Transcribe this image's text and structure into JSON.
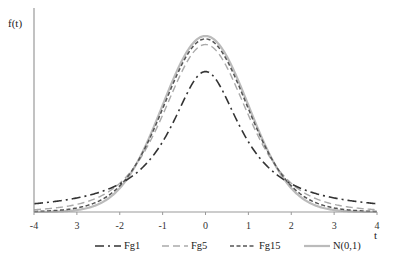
{
  "chart_data": {
    "type": "line",
    "title": "",
    "xlabel": "t",
    "ylabel": "f(t)",
    "xlim": [
      -4,
      4
    ],
    "ylim": [
      0,
      0.42
    ],
    "x_ticks": [
      -4,
      -3,
      -2,
      -1,
      0,
      1,
      2,
      3,
      4
    ],
    "x_tick_labels": [
      "-4",
      "3",
      "-2",
      "-1",
      "0",
      "1",
      "2",
      "3",
      "4"
    ],
    "grid": false,
    "legend_position": "bottom",
    "series": [
      {
        "name": "Fg1",
        "style": "dash-dot",
        "color": "#333333",
        "df": 1,
        "peak": 0.318,
        "values": [
          [
            -4,
            0.019
          ],
          [
            -3,
            0.032
          ],
          [
            -2,
            0.064
          ],
          [
            -1,
            0.159
          ],
          [
            0,
            0.318
          ],
          [
            1,
            0.159
          ],
          [
            2,
            0.064
          ],
          [
            3,
            0.032
          ],
          [
            4,
            0.019
          ]
        ]
      },
      {
        "name": "Fg5",
        "style": "long-dash",
        "color": "#aaaaaa",
        "df": 5,
        "peak": 0.38,
        "values": [
          [
            -4,
            0.005
          ],
          [
            -3,
            0.017
          ],
          [
            -2,
            0.065
          ],
          [
            -1,
            0.22
          ],
          [
            0,
            0.38
          ],
          [
            1,
            0.22
          ],
          [
            2,
            0.065
          ],
          [
            3,
            0.017
          ],
          [
            4,
            0.005
          ]
        ]
      },
      {
        "name": "Fg15",
        "style": "dashed",
        "color": "#555555",
        "df": 15,
        "peak": 0.393,
        "values": [
          [
            -4,
            0.001
          ],
          [
            -3,
            0.008
          ],
          [
            -2,
            0.058
          ],
          [
            -1,
            0.235
          ],
          [
            0,
            0.393
          ],
          [
            1,
            0.235
          ],
          [
            2,
            0.058
          ],
          [
            3,
            0.008
          ],
          [
            4,
            0.001
          ]
        ]
      },
      {
        "name": "N(0,1)",
        "style": "solid",
        "color": "#bbbbbb",
        "df": null,
        "peak": 0.399,
        "values": [
          [
            -4,
            0.0001
          ],
          [
            -3,
            0.004
          ],
          [
            -2,
            0.054
          ],
          [
            -1,
            0.242
          ],
          [
            0,
            0.399
          ],
          [
            1,
            0.242
          ],
          [
            2,
            0.054
          ],
          [
            3,
            0.004
          ],
          [
            4,
            0.0001
          ]
        ]
      }
    ]
  }
}
